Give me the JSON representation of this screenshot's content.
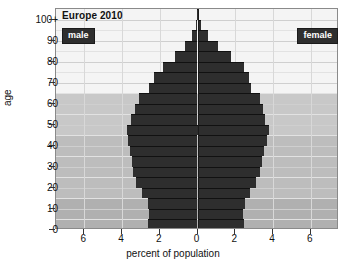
{
  "chart_data": {
    "type": "bar",
    "title": "Europe 2010",
    "xlabel": "percent of population",
    "ylabel": "age",
    "orientation": "population-pyramid",
    "xlim": [
      -7.5,
      7.5
    ],
    "ylim": [
      0,
      105
    ],
    "grid": true,
    "legend_position": "inside-top-corners",
    "x_tick_labels": [
      "6",
      "4",
      "2",
      "0",
      "2",
      "4",
      "6"
    ],
    "x_tick_values": [
      -6,
      -4,
      -2,
      0,
      2,
      4,
      6
    ],
    "y_tick_labels": [
      "0",
      "10",
      "20",
      "30",
      "40",
      "50",
      "60",
      "70",
      "80",
      "90",
      "100+"
    ],
    "y_tick_values": [
      0,
      10,
      20,
      30,
      40,
      50,
      60,
      70,
      80,
      90,
      100
    ],
    "categories": [
      "0-4",
      "5-9",
      "10-14",
      "15-19",
      "20-24",
      "25-29",
      "30-34",
      "35-39",
      "40-44",
      "45-49",
      "50-54",
      "55-59",
      "60-64",
      "65-69",
      "70-74",
      "75-79",
      "80-84",
      "85-89",
      "90-94",
      "95-99",
      "100+"
    ],
    "series": [
      {
        "name": "male",
        "color": "#2e2e2e",
        "direction": "left",
        "values": [
          2.6,
          2.55,
          2.65,
          2.95,
          3.25,
          3.4,
          3.45,
          3.6,
          3.7,
          3.75,
          3.5,
          3.3,
          3.1,
          2.55,
          2.3,
          1.85,
          1.2,
          0.65,
          0.3,
          0.1,
          0.04
        ]
      },
      {
        "name": "female",
        "color": "#2e2e2e",
        "direction": "right",
        "values": [
          2.45,
          2.4,
          2.5,
          2.8,
          3.1,
          3.3,
          3.4,
          3.55,
          3.7,
          3.8,
          3.6,
          3.45,
          3.3,
          2.85,
          2.75,
          2.45,
          1.8,
          1.1,
          0.55,
          0.2,
          0.06
        ]
      }
    ],
    "shaded_bands": [
      {
        "name": "older-working-band",
        "from_age": 45,
        "to_age": 65,
        "color": "#c8c8c8"
      },
      {
        "name": "prime-working-band",
        "from_age": 15,
        "to_age": 45,
        "color": "#bdbdbd"
      },
      {
        "name": "youth-band",
        "from_age": 0,
        "to_age": 15,
        "color": "#b0b0b0"
      },
      {
        "name": "upper-band",
        "from_age": 65,
        "to_age": 105,
        "color": "#f4f4f4"
      }
    ]
  },
  "legend": {
    "male_label": "male",
    "female_label": "female"
  }
}
